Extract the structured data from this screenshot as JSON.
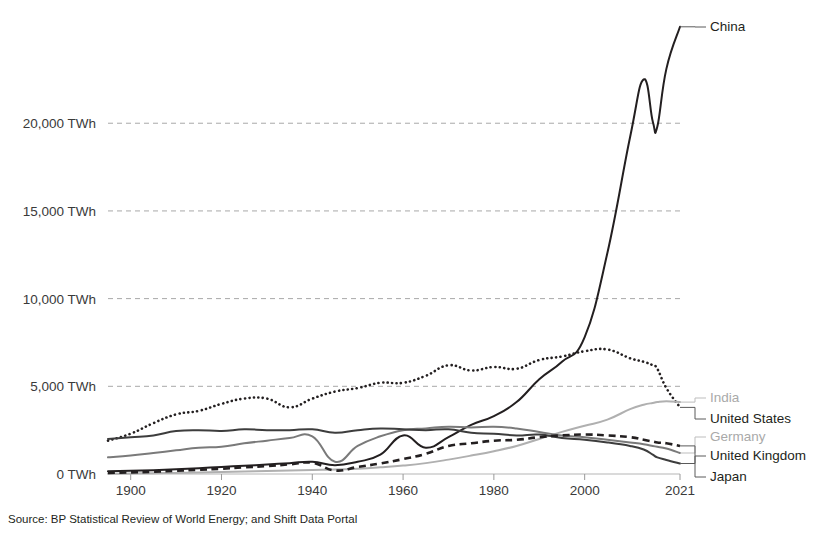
{
  "source_note": "Source: BP Statistical Review of World Energy; and Shift Data Portal",
  "axis": {
    "y_ticks": [
      "0 TWh",
      "5,000 TWh",
      "10,000 TWh",
      "15,000 TWh",
      "20,000 TWh"
    ],
    "x_ticks": [
      "1900",
      "1920",
      "1940",
      "1960",
      "1980",
      "2000",
      "2021"
    ]
  },
  "labels": {
    "china": "China",
    "india": "India",
    "united_states": "United States",
    "germany": "Germany",
    "united_kingdom": "United Kingdom",
    "japan": "Japan"
  },
  "colors": {
    "dark": "#231f20",
    "mid_gray": "#6f6f6f",
    "light_gray": "#b0b0b0",
    "grid": "#a8a8a8",
    "background": "#ffffff"
  },
  "chart_data": {
    "type": "line",
    "title": "",
    "xlabel": "",
    "ylabel": "TWh",
    "xlim": [
      1895,
      2021
    ],
    "ylim": [
      0,
      26000
    ],
    "grid": true,
    "ytick_values": [
      0,
      5000,
      10000,
      15000,
      20000
    ],
    "xtick_values": [
      1900,
      1920,
      1940,
      1960,
      1980,
      2000,
      2021
    ],
    "legend_position": "right-endpoints",
    "x": [
      1895,
      1900,
      1905,
      1910,
      1915,
      1920,
      1925,
      1930,
      1935,
      1940,
      1945,
      1950,
      1955,
      1960,
      1965,
      1970,
      1975,
      1980,
      1985,
      1990,
      1995,
      2000,
      2005,
      2010,
      2013,
      2015,
      2016,
      2018,
      2021
    ],
    "series": [
      {
        "name": "China",
        "style": "solid",
        "color": "#231f20",
        "label_color": "dark",
        "values": [
          150,
          180,
          220,
          270,
          330,
          400,
          470,
          540,
          620,
          700,
          500,
          700,
          1100,
          2200,
          1500,
          2100,
          2800,
          3300,
          4100,
          5400,
          6400,
          7800,
          12600,
          19200,
          22500,
          20100,
          19800,
          23100,
          25500
        ]
      },
      {
        "name": "United States",
        "style": "dotted",
        "color": "#231f20",
        "label_color": "dark",
        "values": [
          1900,
          2300,
          2900,
          3400,
          3600,
          4000,
          4300,
          4300,
          3800,
          4300,
          4700,
          4900,
          5200,
          5200,
          5600,
          6200,
          5900,
          6100,
          6000,
          6500,
          6700,
          7000,
          7100,
          6600,
          6400,
          6200,
          6000,
          4900,
          3800
        ]
      },
      {
        "name": "India",
        "style": "solid",
        "color": "#b0b0b0",
        "label_color": "light",
        "values": [
          20,
          30,
          45,
          60,
          80,
          110,
          140,
          170,
          200,
          230,
          250,
          300,
          380,
          480,
          620,
          820,
          1050,
          1300,
          1600,
          2000,
          2400,
          2750,
          3100,
          3700,
          3950,
          4050,
          4100,
          4150,
          4100
        ]
      },
      {
        "name": "Germany",
        "style": "solid",
        "color": "#7a7a7a",
        "label_color": "light",
        "values": [
          950,
          1050,
          1200,
          1350,
          1500,
          1550,
          1750,
          1900,
          2050,
          2150,
          700,
          1600,
          2150,
          2500,
          2600,
          2700,
          2650,
          2700,
          2600,
          2400,
          2200,
          2100,
          1950,
          1800,
          1700,
          1600,
          1550,
          1450,
          1200
        ]
      },
      {
        "name": "United Kingdom",
        "style": "solid",
        "color": "#3d3d3d",
        "label_color": "dark",
        "values": [
          2000,
          2100,
          2200,
          2450,
          2500,
          2450,
          2550,
          2500,
          2500,
          2550,
          2350,
          2500,
          2600,
          2550,
          2500,
          2550,
          2350,
          2300,
          2200,
          2250,
          2050,
          1950,
          1800,
          1600,
          1400,
          1100,
          950,
          800,
          600
        ]
      },
      {
        "name": "Japan",
        "style": "dashed",
        "color": "#231f20",
        "label_color": "dark",
        "values": [
          60,
          90,
          130,
          180,
          240,
          300,
          380,
          450,
          550,
          640,
          200,
          400,
          600,
          850,
          1150,
          1600,
          1750,
          1900,
          1950,
          2100,
          2200,
          2250,
          2200,
          2100,
          1950,
          1850,
          1800,
          1750,
          1600
        ]
      }
    ]
  }
}
